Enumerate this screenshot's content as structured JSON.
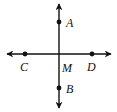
{
  "diagram": {
    "type": "perpendicular-lines",
    "colors": {
      "stroke": "#111111",
      "background": "#ffffff"
    },
    "lines": [
      {
        "id": "vertical",
        "through": [
          "A",
          "M",
          "B"
        ],
        "arrows": "both"
      },
      {
        "id": "horizontal",
        "through": [
          "C",
          "M",
          "D"
        ],
        "arrows": "both"
      }
    ],
    "points": [
      {
        "name": "A",
        "label": "A",
        "x": 59,
        "y": 22,
        "dot": true
      },
      {
        "name": "B",
        "label": "B",
        "x": 59,
        "y": 88,
        "dot": true
      },
      {
        "name": "C",
        "label": "C",
        "x": 25,
        "y": 54,
        "dot": true
      },
      {
        "name": "D",
        "label": "D",
        "x": 92,
        "y": 54,
        "dot": true
      },
      {
        "name": "M",
        "label": "M",
        "x": 59,
        "y": 54,
        "dot": false
      }
    ],
    "labels": {
      "A": "A",
      "B": "B",
      "C": "C",
      "D": "D",
      "M": "M"
    }
  }
}
